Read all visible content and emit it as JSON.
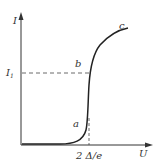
{
  "diagram": {
    "type": "current-voltage characteristic",
    "axes": {
      "y_label": "I",
      "x_label": "U"
    },
    "markers": {
      "current_level": {
        "base": "I",
        "subscript": "1"
      },
      "voltage_threshold": "2 Δ/e"
    },
    "points": [
      {
        "label": "a"
      },
      {
        "label": "b"
      },
      {
        "label": "c"
      }
    ],
    "colors": {
      "curve": "#222222",
      "axis": "#333333",
      "dashed": "#444444"
    }
  }
}
